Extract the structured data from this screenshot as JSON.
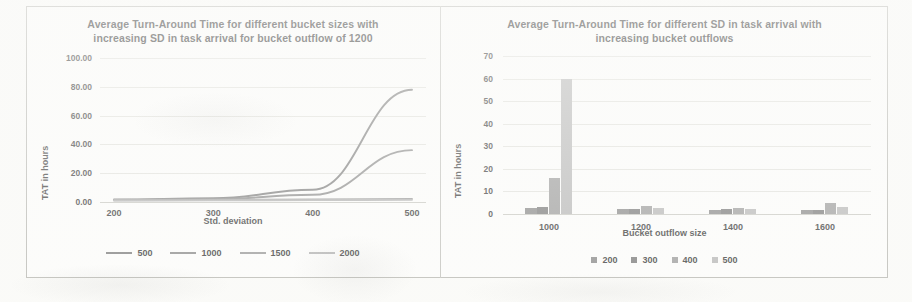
{
  "figure": {
    "background_color": "#fdfdfc",
    "border_color": "#b9b9b4"
  },
  "charts": [
    {
      "id": "left",
      "title_line1": "Average Turn-Around Time for different bucket sizes  with",
      "title_line2": "increasing SD in task arrival for bucket outflow of 1200"
    },
    {
      "id": "right",
      "title_line1": "Average Turn-Around Time for different SD in task arrival with",
      "title_line2": "increasing bucket outflows"
    }
  ],
  "chart_data": [
    {
      "type": "line",
      "title": "Average Turn-Around Time for different bucket sizes  with increasing SD in task arrival for bucket outflow of 1200",
      "xlabel": "Std. deviation",
      "ylabel": "TAT in hours",
      "x": [
        200,
        300,
        400,
        500
      ],
      "xlim": [
        150,
        550
      ],
      "ylim": [
        0,
        100
      ],
      "yticks": [
        "0.00",
        "20.00",
        "40.00",
        "60.00",
        "80.00",
        "100.00"
      ],
      "xticks": [
        "200",
        "300",
        "400",
        "500"
      ],
      "grid": true,
      "legend_position": "bottom",
      "series": [
        {
          "name": "500",
          "values": [
            1.8,
            2.6,
            8.5,
            78.0
          ],
          "color": "#7f7f7f"
        },
        {
          "name": "1000",
          "values": [
            1.5,
            2.0,
            5.0,
            36.0
          ],
          "color": "#8c8c8c"
        },
        {
          "name": "1500",
          "values": [
            1.2,
            1.4,
            1.8,
            2.2
          ],
          "color": "#9a9a9a"
        },
        {
          "name": "2000",
          "values": [
            1.0,
            1.1,
            1.3,
            1.5
          ],
          "color": "#b3b3b3"
        }
      ]
    },
    {
      "type": "bar",
      "title": "Average Turn-Around Time for different SD in task arrival with increasing bucket outflows",
      "xlabel": "Bucket outflow size",
      "ylabel": "TAT in hours",
      "categories": [
        "1000",
        "1200",
        "1400",
        "1600"
      ],
      "ylim": [
        0,
        70
      ],
      "yticks": [
        "0",
        "10",
        "20",
        "30",
        "40",
        "50",
        "60",
        "70"
      ],
      "grid": true,
      "legend_position": "bottom",
      "series": [
        {
          "name": "200",
          "values": [
            2.5,
            2.0,
            1.8,
            1.6
          ],
          "color": "#8a8a8a"
        },
        {
          "name": "300",
          "values": [
            3.0,
            2.2,
            2.0,
            1.8
          ],
          "color": "#7b7b7b"
        },
        {
          "name": "400",
          "values": [
            16.0,
            3.5,
            2.6,
            5.0
          ],
          "color": "#9d9d9d"
        },
        {
          "name": "500",
          "values": [
            60.0,
            2.6,
            2.0,
            3.2
          ],
          "color": "#b8b8b8"
        }
      ]
    }
  ]
}
